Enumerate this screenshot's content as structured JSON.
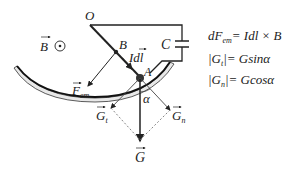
{
  "diagram": {
    "colors": {
      "ink": "#222222",
      "rail_fill": "#e8e8e8",
      "dash": "#777777",
      "background": "#ffffff"
    },
    "labels": {
      "O": "O",
      "B_point": "B",
      "A_point": "A",
      "C": "C",
      "field": "B",
      "Idl": "Idl",
      "F_em": "F",
      "F_em_sub": "em",
      "G": "G",
      "G_t": "G",
      "G_t_sub": "t",
      "G_n": "G",
      "G_n_sub": "n",
      "alpha": "α"
    },
    "equations": [
      "dF_em = Idl × B",
      "|G_t| = G sin α",
      "|G_n| = G cos α"
    ],
    "equation_parts": {
      "eq1_lhs": "dF",
      "eq1_lhs_sub": "em",
      "eq1_rhs": "= Idl × B",
      "eq2_lhs": "|G",
      "eq2_sub": "t",
      "eq2_rhs": "|= Gsinα",
      "eq3_lhs": "|G",
      "eq3_sub": "n",
      "eq3_rhs": "|= Gcosα"
    },
    "field_symbol": "dot-in-circle (out of page)"
  }
}
